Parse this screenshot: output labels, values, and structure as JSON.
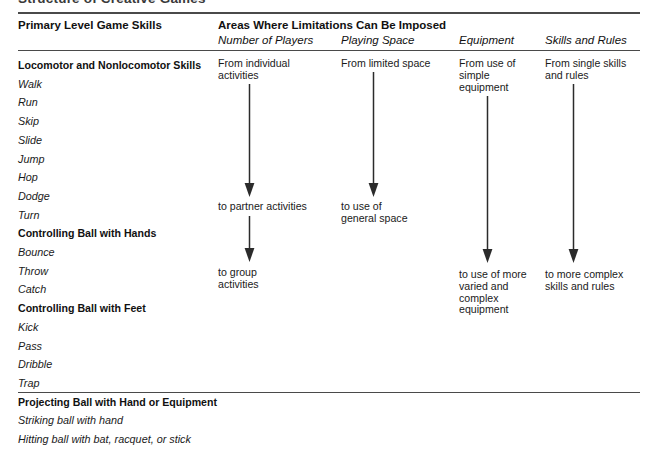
{
  "figure": {
    "title": "Structure of Creative Games"
  },
  "header": {
    "left_column": "Primary Level Game Skills",
    "right_group": "Areas Where Limitations Can Be Imposed",
    "columns": [
      "Number of Players",
      "Playing Space",
      "Equipment",
      "Skills and Rules"
    ]
  },
  "skills": [
    {
      "group": "Locomotor and Nonlocomotor Skills",
      "items": [
        "Walk",
        "Run",
        "Skip",
        "Slide",
        "Jump",
        "Hop",
        "Dodge",
        "Turn"
      ]
    },
    {
      "group": "Controlling Ball with Hands",
      "items": [
        "Bounce",
        "Throw",
        "Catch"
      ]
    },
    {
      "group": "Controlling Ball with Feet",
      "items": [
        "Kick",
        "Pass",
        "Dribble",
        "Trap"
      ]
    },
    {
      "group": "Projecting Ball with Hand or Equipment",
      "items": [
        "Striking ball with hand",
        "Hitting ball with bat, racquet, or stick"
      ]
    }
  ],
  "progressions": [
    {
      "column": "Number of Players",
      "steps": [
        "From individual\nactivities",
        "to partner activities",
        "to group\nactivities"
      ]
    },
    {
      "column": "Playing Space",
      "steps": [
        "From limited space",
        "to use of\ngeneral space"
      ]
    },
    {
      "column": "Equipment",
      "steps": [
        "From use of\nsimple\nequipment",
        "to use of more\nvaried and\ncomplex\nequipment"
      ]
    },
    {
      "column": "Skills and Rules",
      "steps": [
        "From single skills\nand rules",
        "to more complex\nskills and rules"
      ]
    }
  ],
  "colors": {
    "rule": "#4a4a4a",
    "text": "#1a1a1a",
    "arrow": "#2b2b2b",
    "background": "#ffffff"
  }
}
